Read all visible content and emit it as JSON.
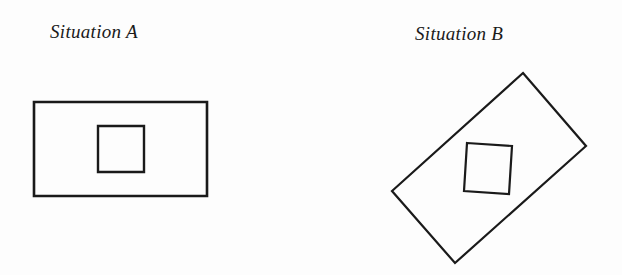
{
  "situations": [
    {
      "label": "Situation A",
      "outer_shape": "rectangle",
      "inner_shape": "square",
      "orientation": "upright",
      "outer_points": "34,102 207,102 207,196 34,196",
      "inner_points": "98,126 144,126 144,172 98,172",
      "outer_stroke_width": 2.6,
      "inner_stroke_width": 2.4
    },
    {
      "label": "Situation B",
      "outer_shape": "rectangle",
      "inner_shape": "square",
      "orientation": "tilted",
      "outer_points": "523,73 586,146 455,263 392,191",
      "inner_points": "467,143 512,146 509,194 464,191",
      "outer_stroke_width": 2.2,
      "inner_stroke_width": 2.2
    }
  ],
  "colors": {
    "stroke": "#1a1a1a",
    "background": "#fdfdfd"
  }
}
